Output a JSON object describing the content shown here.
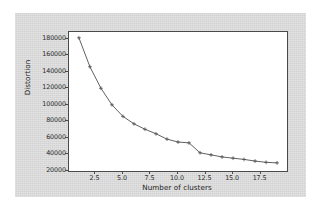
{
  "figure": {
    "background_color": "#d7d7d7",
    "plot_area_color": "#ffffff",
    "axis_color": "#4a4a4a"
  },
  "chart_data": {
    "type": "line",
    "title": "",
    "xlabel": "Number of clusters",
    "ylabel": "Distortion",
    "xlim": [
      0.1,
      19.9
    ],
    "ylim": [
      20000,
      188000
    ],
    "xticks": [
      "2.5",
      "5.0",
      "7.5",
      "10.0",
      "12.5",
      "15.0",
      "17.5"
    ],
    "xtick_values": [
      2.5,
      5.0,
      7.5,
      10.0,
      12.5,
      15.0,
      17.5
    ],
    "yticks": [
      "20000",
      "40000",
      "60000",
      "80000",
      "100000",
      "120000",
      "140000",
      "160000",
      "180000"
    ],
    "ytick_values": [
      20000,
      40000,
      60000,
      80000,
      100000,
      120000,
      140000,
      160000,
      180000
    ],
    "grid": false,
    "legend": null,
    "marker": "+",
    "line_color": "#4f4f4f",
    "x": [
      1,
      2,
      3,
      4,
      5,
      6,
      7,
      8,
      9,
      10,
      11,
      12,
      13,
      14,
      15,
      16,
      17,
      18,
      19
    ],
    "series": [
      {
        "name": "Distortion",
        "values": [
          181000,
          146000,
          120000,
          100000,
          86000,
          77000,
          70500,
          65000,
          58500,
          55000,
          54000,
          42000,
          39500,
          37000,
          35500,
          34000,
          32000,
          30500,
          29800
        ]
      }
    ]
  }
}
